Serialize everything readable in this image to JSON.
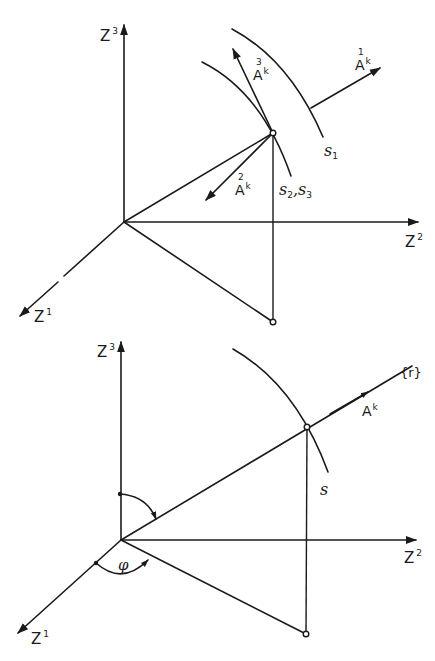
{
  "figure_top": {
    "axes": {
      "z3": {
        "base": "Z",
        "sup": "3"
      },
      "z2": {
        "base": "Z",
        "sup": "2"
      },
      "z1": {
        "base": "Z",
        "sup": "1"
      }
    },
    "vectors": {
      "a1": {
        "index": "1",
        "base": "A",
        "sup": "k"
      },
      "a2": {
        "index": "2",
        "base": "A",
        "sup": "k"
      },
      "a3": {
        "index": "3",
        "base": "A",
        "sup": "k"
      }
    },
    "surfaces": {
      "s1": {
        "base": "ѕ",
        "sub": "1"
      },
      "s23": {
        "base1": "ѕ",
        "sub1": "2",
        "sep": ",",
        "base2": "ѕ",
        "sub2": "3"
      }
    }
  },
  "figure_bottom": {
    "axes": {
      "z3": {
        "base": "Z",
        "sup": "3"
      },
      "z2": {
        "base": "Z",
        "sup": "2"
      },
      "z1": {
        "base": "Z",
        "sup": "1"
      }
    },
    "vector": {
      "base": "A",
      "sup": "k"
    },
    "ray_label": "{r}",
    "surface": {
      "base": "ѕ"
    },
    "angle_label": "φ"
  },
  "colors": {
    "ink": "#1a1a1a",
    "paper": "#ffffff"
  }
}
